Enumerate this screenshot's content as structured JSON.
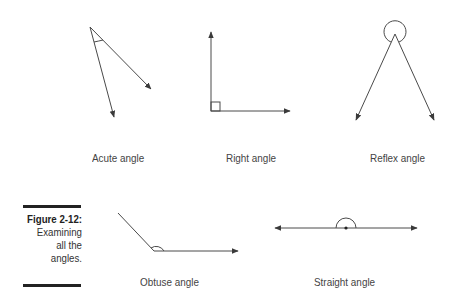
{
  "figure": {
    "number": "Figure 2-12:",
    "caption_lines": [
      "Examining",
      "all the",
      "angles."
    ]
  },
  "angles": [
    {
      "name": "acute",
      "label": "Acute angle"
    },
    {
      "name": "right",
      "label": "Right angle"
    },
    {
      "name": "reflex",
      "label": "Reflex angle"
    },
    {
      "name": "obtuse",
      "label": "Obtuse angle"
    },
    {
      "name": "straight",
      "label": "Straight angle"
    }
  ],
  "colors": {
    "line": "#4a4a4a",
    "caption_bar": "#222222"
  }
}
